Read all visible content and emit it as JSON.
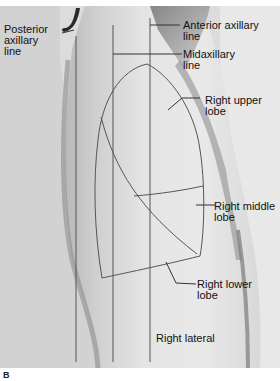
{
  "figure": {
    "panel_letter": "B",
    "view_label": "Right lateral",
    "lines": [
      {
        "id": "posterior",
        "label": "Posterior\naxillary\nline"
      },
      {
        "id": "midaxillary",
        "label": "Midaxillary\nline"
      },
      {
        "id": "anterior",
        "label": "Anterior axillary\nline"
      }
    ],
    "lobes": [
      {
        "id": "upper",
        "label": "Right upper\nlobe"
      },
      {
        "id": "middle",
        "label": "Right middle\nlobe"
      },
      {
        "id": "lower",
        "label": "Right lower\nlobe"
      }
    ],
    "colors": {
      "background": "#d8d8d8",
      "skin_light": "#e6e6e6",
      "shadow": "#8a8a8a",
      "line": "#555555",
      "text": "#111111"
    }
  }
}
